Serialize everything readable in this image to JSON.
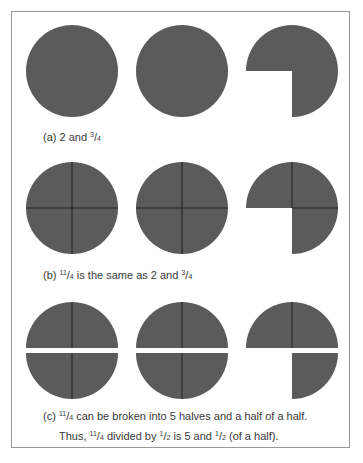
{
  "colors": {
    "fill": "#5b5b5b",
    "divider": "#222222",
    "text": "#3a3a3a",
    "frame": "#9a9a9a",
    "background": "#ffffff"
  },
  "panels": {
    "a": {
      "prefix": "(a) 2 and",
      "frac": {
        "num": "3",
        "den": "4"
      },
      "suffix": "",
      "shapes": [
        "whole circle",
        "whole circle",
        "three-quarter circle"
      ]
    },
    "b": {
      "prefix": "(b)",
      "frac1": {
        "num": "11",
        "den": "4"
      },
      "middle": "is the same as 2 and",
      "frac2": {
        "num": "3",
        "den": "4"
      },
      "shapes": [
        "circle divided in quarters",
        "circle divided in quarters",
        "three quarters"
      ]
    },
    "c": {
      "line1": {
        "prefix": "(c)",
        "frac": {
          "num": "11",
          "den": "4"
        },
        "suffix": "can be broken into 5 halves and a half of a half."
      },
      "line2": {
        "prefix": "Thus,",
        "frac1": {
          "num": "11",
          "den": "4"
        },
        "middle": "divided by",
        "frac2": {
          "num": "1",
          "den": "2"
        },
        "middle2": "is 5 and",
        "frac3": {
          "num": "1",
          "den": "2"
        },
        "suffix": "(of a half)."
      },
      "shapes": [
        "circle split into halves",
        "circle split into halves",
        "half and a quarter"
      ]
    }
  }
}
